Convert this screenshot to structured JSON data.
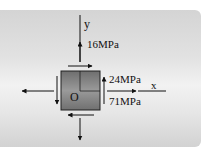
{
  "diagram": {
    "type": "plane-stress-element",
    "axes": {
      "y_label": "y",
      "x_label": "x",
      "origin_label": "O"
    },
    "stresses": {
      "sigma_y": "16MPa",
      "tau_xy": "24MPa",
      "sigma_x": "71MPa"
    },
    "colors": {
      "panel": "#e0e0e0",
      "element_fill": "#8a8a8a",
      "lines": "#111111"
    }
  }
}
